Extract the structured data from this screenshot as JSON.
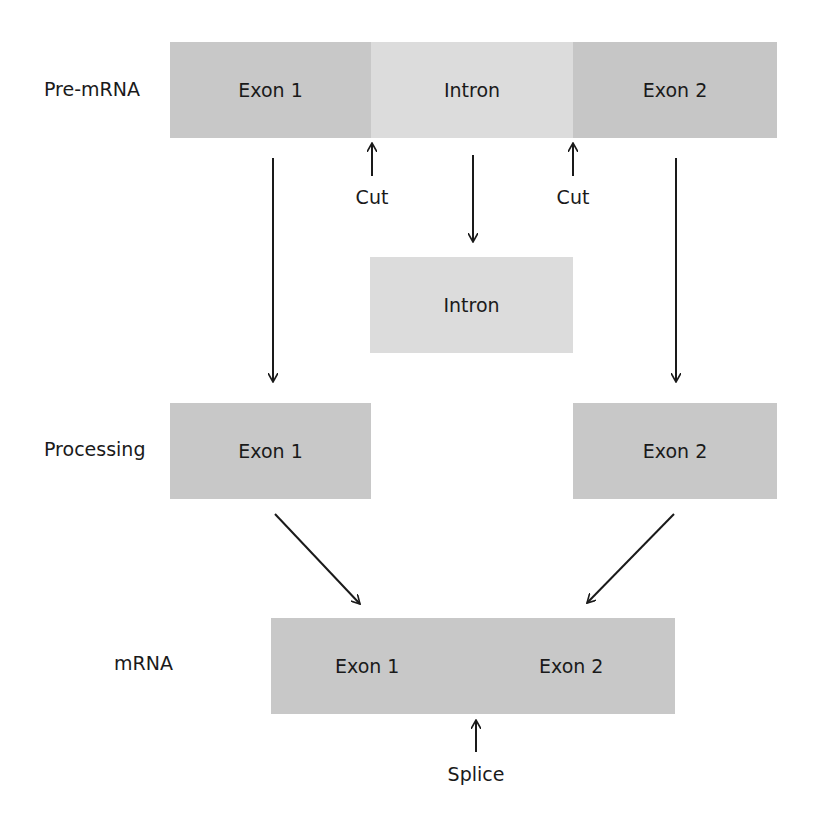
{
  "colors": {
    "exon": "#c9c9c9",
    "intron": "#dedede",
    "text": "#1a1a1a",
    "arrow": "#1a1a1a"
  },
  "rows": {
    "pre_mrna": {
      "label": "Pre-mRNA",
      "segments": [
        {
          "id": "exon1",
          "text": "Exon 1"
        },
        {
          "id": "intron",
          "text": "Intron"
        },
        {
          "id": "exon2",
          "text": "Exon 2"
        }
      ],
      "cut_labels": [
        "Cut",
        "Cut"
      ]
    },
    "excised": {
      "intron_text": "Intron"
    },
    "processing": {
      "label": "Processing",
      "exon1_text": "Exon 1",
      "exon2_text": "Exon 2"
    },
    "mrna": {
      "label": "mRNA",
      "exon1_text": "Exon 1",
      "exon2_text": "Exon 2",
      "splice_label": "Splice"
    }
  }
}
